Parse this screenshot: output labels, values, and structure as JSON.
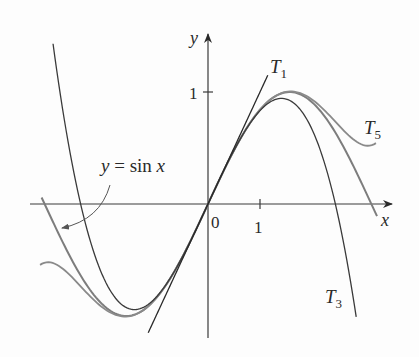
{
  "chart_data": {
    "type": "line",
    "title": "",
    "xlabel": "x",
    "ylabel": "y",
    "x_ticks": [
      {
        "value": 0,
        "label": "0"
      },
      {
        "value": 1,
        "label": "1"
      }
    ],
    "y_ticks": [
      {
        "value": 1,
        "label": "1"
      }
    ],
    "xlim": [
      -3.42,
      3.57
    ],
    "ylim": [
      -1.2,
      1.52
    ],
    "grid": false,
    "legend": "none",
    "series": [
      {
        "name": "y = sin x",
        "expr": "sin(x)",
        "domain": [
          -3.2,
          3.25
        ],
        "color": "#7a7a7a"
      },
      {
        "name": "T1",
        "expr": "x",
        "domain": [
          -1.15,
          1.15
        ],
        "color": "#2a2a2a"
      },
      {
        "name": "T3",
        "expr": "x - x^3/6",
        "domain": [
          -2.98,
          2.85
        ],
        "color": "#3a3a3a"
      },
      {
        "name": "T5",
        "expr": "x - x^3/6 + x^5/120",
        "domain": [
          -3.23,
          3.23
        ],
        "color": "#7a7a7a"
      }
    ],
    "annotations": [
      {
        "text": "T1",
        "sub": "1",
        "main": "T",
        "x": 1.22,
        "y": 1.3
      },
      {
        "text": "T3",
        "sub": "3",
        "main": "T",
        "x": 2.25,
        "y": -1.08
      },
      {
        "text": "T5",
        "sub": "5",
        "main": "T",
        "x": 3.3,
        "y": 0.57
      },
      {
        "text": "y = sin x",
        "x": -2.1,
        "y": 0.38,
        "arrow_to": [
          -2.85,
          -0.2
        ]
      }
    ]
  },
  "labels": {
    "y_axis": "y",
    "x_axis": "x",
    "origin": "0",
    "x_tick_1": "1",
    "y_tick_1": "1",
    "sin_label_y": "y",
    "sin_label_eq": " = sin ",
    "sin_label_x": "x",
    "t1_main": "T",
    "t1_sub": "1",
    "t3_main": "T",
    "t3_sub": "3",
    "t5_main": "T",
    "t5_sub": "5"
  }
}
